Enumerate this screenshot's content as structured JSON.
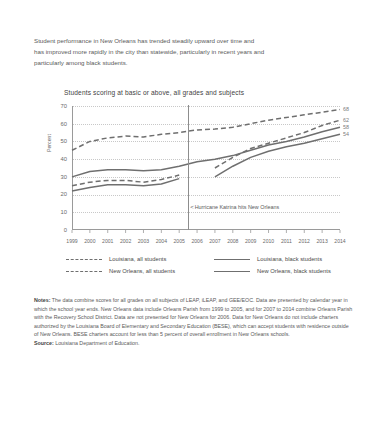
{
  "intro": {
    "lines": [
      "Student performance in New Orleans has trended steadily upward over time and",
      "has improved more rapidly in the city than statewide, particularly in recent years and",
      "particularly among black students."
    ]
  },
  "chart_data": {
    "type": "line",
    "title": "Students scoring at basic or above, all grades and subjects",
    "xlabel": "",
    "ylabel": "Percent",
    "ylim": [
      0,
      70
    ],
    "yticks": [
      0,
      10,
      20,
      30,
      40,
      50,
      60,
      70
    ],
    "grid": true,
    "legend_position": "bottom",
    "x": [
      1999,
      2000,
      2001,
      2002,
      2003,
      2004,
      2005,
      2006,
      2007,
      2008,
      2009,
      2010,
      2011,
      2012,
      2013,
      2014
    ],
    "xticklabels": [
      "1999",
      "2000",
      "2001",
      "2002",
      "2003",
      "2004",
      "2005",
      "2006",
      "2007",
      "2008",
      "2009",
      "2010",
      "2011",
      "2012",
      "2013",
      "2014"
    ],
    "series": [
      {
        "name": "Louisiana, all students",
        "style": "dashed",
        "color": "#6f6f6f",
        "end_label": "68",
        "values": [
          45,
          50,
          52,
          53,
          52.5,
          54,
          55,
          56.5,
          57,
          58,
          60,
          62,
          63.5,
          65,
          66.5,
          68
        ]
      },
      {
        "name": "Louisiana, black students",
        "style": "solid",
        "color": "#6f6f6f",
        "end_label": "58",
        "values": [
          30,
          33,
          34,
          34,
          33.5,
          34,
          36,
          38.5,
          40,
          42,
          45,
          48,
          50,
          52.5,
          55.5,
          58
        ]
      },
      {
        "name": "New Orleans, all students",
        "style": "dashed",
        "color": "#6f6f6f",
        "end_label": "62",
        "values": [
          25,
          27,
          28,
          28,
          27,
          28.5,
          31,
          null,
          35,
          41,
          46,
          49,
          52,
          55,
          59,
          62
        ]
      },
      {
        "name": "New Orleans, black students",
        "style": "solid",
        "color": "#6f6f6f",
        "end_label": "54",
        "values": [
          22,
          24,
          25.5,
          25.5,
          25,
          26,
          29,
          null,
          30,
          36,
          41,
          44.5,
          47,
          49,
          51.5,
          54
        ]
      }
    ],
    "annotations": [
      {
        "text": "Hurricane Katrina hits New Orleans",
        "arrow": "<",
        "x": 2005.5,
        "type": "vertical-line-with-label"
      }
    ]
  },
  "legend": {
    "entries": [
      {
        "label": "Louisiana, all students",
        "style": "dashed"
      },
      {
        "label": "Louisiana, black students",
        "style": "solid"
      },
      {
        "label": "New Orleans, all students",
        "style": "dashed"
      },
      {
        "label": "New Orleans, black students",
        "style": "solid"
      }
    ]
  },
  "notes": {
    "label": "Notes:",
    "body": " The data combine scores for all grades on all subjects of LEAP, iLEAP, and GEE/EOC. Data are presented by calendar year in which the school year ends. New Orleans data include Orleans Parish from 1999 to 2005, and for 2007 to 2014 combine Orleans Parish with the Recovery School District. Data are not presented for New Orleans for 2006. Data for New Orleans do not include charters authorized by the Louisiana Board of Elementary and Secondary Education (BESE), which can accept students with residence outside of New Orleans. BESE charters account for less than 5 percent of overall enrollment in New Orleans schools.",
    "source_label": "Source:",
    "source_body": " Louisiana Department of Education."
  }
}
